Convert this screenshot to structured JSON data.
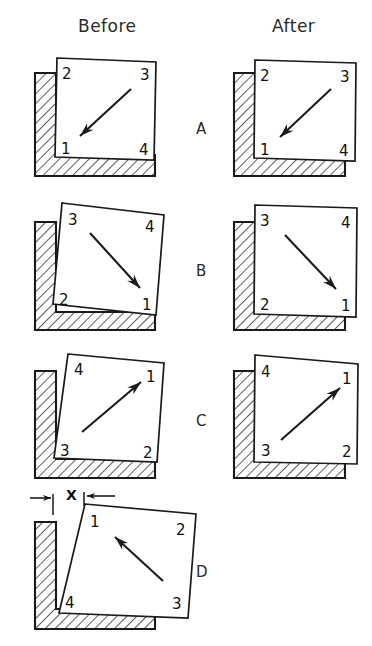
{
  "figure": {
    "background_color": "#ffffff",
    "line_color": "#1a1a1a",
    "hatch_color": "#1a1a1a",
    "fill_color": "#ffffff"
  },
  "headers": {
    "before": "Before",
    "after": "After"
  },
  "dimension": {
    "label": "X",
    "description": "gap dimension callout with opposing arrows"
  },
  "rows": [
    {
      "letter": "A",
      "before": {
        "corners": {
          "top_left": "2",
          "top_right": "3",
          "bottom_left": "1",
          "bottom_right": "4"
        },
        "arrow": "down-left"
      },
      "after": {
        "corners": {
          "top_left": "2",
          "top_right": "3",
          "bottom_left": "1",
          "bottom_right": "4"
        },
        "arrow": "down-left"
      }
    },
    {
      "letter": "B",
      "before": {
        "corners": {
          "top_left": "3",
          "top_right": "4",
          "bottom_left": "2",
          "bottom_right": "1"
        },
        "arrow": "down-right"
      },
      "after": {
        "corners": {
          "top_left": "3",
          "top_right": "4",
          "bottom_left": "2",
          "bottom_right": "1"
        },
        "arrow": "down-right"
      }
    },
    {
      "letter": "C",
      "before": {
        "corners": {
          "top_left": "4",
          "top_right": "1",
          "bottom_left": "3",
          "bottom_right": "2"
        },
        "arrow": "up-right"
      },
      "after": {
        "corners": {
          "top_left": "4",
          "top_right": "1",
          "bottom_left": "3",
          "bottom_right": "2"
        },
        "arrow": "up-right"
      }
    },
    {
      "letter": "D",
      "before": {
        "corners": {
          "top_left": "1",
          "top_right": "2",
          "bottom_left": "4",
          "bottom_right": "3"
        },
        "arrow": "up-left"
      },
      "after": null
    }
  ]
}
